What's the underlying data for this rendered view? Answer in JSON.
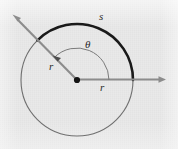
{
  "figure": {
    "background_color": "#e9e9e9",
    "labels": {
      "arc_length": "s",
      "angle": "θ",
      "radius_upper": "r",
      "radius_lower": "r"
    },
    "colors": {
      "arc_highlight": "#1a1a1a",
      "circle_outline": "#6f6f6f",
      "ray": "#8c8c8c",
      "inner_arc": "#7a7a7a",
      "center_dot": "#141414",
      "label_text": "#2b2b2b"
    },
    "geometry": {
      "center_x": 77,
      "center_y": 80,
      "radius": 56,
      "inner_arc_radius": 32,
      "arc_start_degrees": 0,
      "arc_end_degrees": 135,
      "horizontal_ray_tip_x": 165,
      "horizontal_ray_tip_y": 79,
      "diagonal_ray_tip_x": 13,
      "diagonal_ray_tip_y": 15
    }
  }
}
